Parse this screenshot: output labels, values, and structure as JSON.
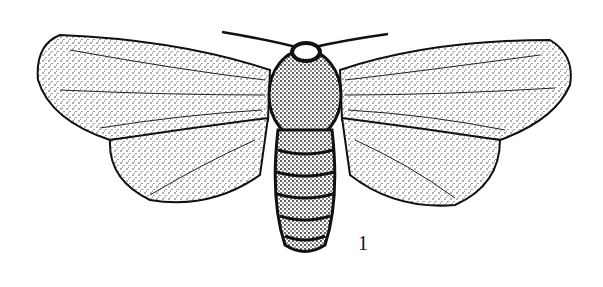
{
  "figure": {
    "style": "black ink stipple engraving",
    "label": "1",
    "colors": {
      "ink": "#111111",
      "paper": "#ffffff"
    }
  }
}
